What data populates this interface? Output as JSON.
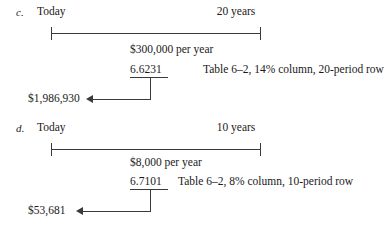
{
  "document": {
    "kind": "annuity-present-value-timeline-worksheet",
    "background_color": "#ffffff",
    "ink_color": "#3a3a3a"
  },
  "diagrams": [
    {
      "id": "c",
      "letter": "c.",
      "start_label": "Today",
      "end_label": "20 years",
      "payment_label": "$300,000 per year",
      "factor_value": "6.6231",
      "factor_note": "Table 6–2, 14% column, 20-period row",
      "result_label": "$1,986,930"
    },
    {
      "id": "d",
      "letter": "d.",
      "start_label": "Today",
      "end_label": "10 years",
      "payment_label": "$8,000 per year",
      "factor_value": "6.7101",
      "factor_note": "Table 6–2, 8% column, 10-period row",
      "result_label": "$53,681"
    }
  ]
}
